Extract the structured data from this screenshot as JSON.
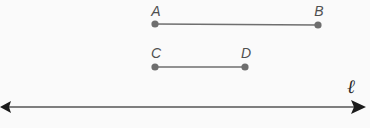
{
  "figure": {
    "background_color": "#fafafa",
    "width": 370,
    "height": 128,
    "segment_color": "#6e6e6e",
    "label_color": "#4f4f4f",
    "axis_color": "#555555",
    "arrow_color": "#1b1b1b",
    "segments": [
      {
        "name": "segment-ab",
        "start_label": "A",
        "end_label": "B",
        "start_x": 155,
        "start_y": 24,
        "end_x": 318,
        "end_y": 25,
        "start_label_x": 156,
        "start_label_y": 16,
        "end_label_x": 319,
        "end_label_y": 16,
        "length_px": 163
      },
      {
        "name": "segment-cd",
        "start_label": "C",
        "end_label": "D",
        "start_x": 155,
        "start_y": 67,
        "end_x": 245,
        "end_y": 67,
        "start_label_x": 156,
        "start_label_y": 58,
        "end_label_x": 246,
        "end_label_y": 58,
        "length_px": 90
      }
    ],
    "line": {
      "name": "line-l",
      "label": "ℓ",
      "label_x": 351,
      "label_y": 93,
      "y": 107,
      "x_start": 3,
      "x_end": 366,
      "double_headed": true
    }
  }
}
